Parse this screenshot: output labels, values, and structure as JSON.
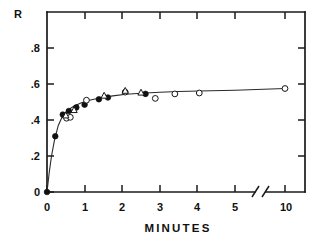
{
  "chart_data": {
    "type": "scatter",
    "title": "",
    "xlabel": "MINUTES",
    "ylabel": "R",
    "xlim": [
      0,
      10
    ],
    "ylim": [
      0,
      0.95
    ],
    "grid": false,
    "legend": "none",
    "axis_break": {
      "after": 5,
      "before": 10,
      "note": "x-axis broken between 5 and 10"
    },
    "xticks": [
      0,
      1,
      2,
      3,
      4,
      5,
      10
    ],
    "xtick_labels": [
      "0",
      "1",
      "2",
      "3",
      "4",
      "5",
      "10"
    ],
    "yticks": [
      0,
      0.2,
      0.4,
      0.6,
      0.8
    ],
    "ytick_labels": [
      "0",
      ".2",
      ".4",
      ".6",
      ".8"
    ],
    "series": [
      {
        "name": "filled-circles",
        "marker": "filled-circle",
        "x": [
          0.0,
          0.22,
          0.42,
          0.58,
          0.78,
          1.0,
          1.38,
          1.62,
          2.62
        ],
        "y": [
          0.0,
          0.31,
          0.43,
          0.45,
          0.47,
          0.485,
          0.515,
          0.525,
          0.545
        ]
      },
      {
        "name": "open-circles",
        "marker": "open-circle",
        "x": [
          0.52,
          0.62,
          1.05,
          2.08,
          2.88,
          3.4,
          4.05,
          10.0
        ],
        "y": [
          0.41,
          0.415,
          0.51,
          0.555,
          0.52,
          0.545,
          0.55,
          0.575
        ]
      },
      {
        "name": "open-triangles",
        "marker": "open-triangle",
        "x": [
          0.5,
          0.72,
          1.52,
          2.08,
          2.5
        ],
        "y": [
          0.425,
          0.455,
          0.535,
          0.562,
          0.552
        ]
      }
    ],
    "fitted_curve": {
      "description": "rising saturating curve through the data",
      "x": [
        0.0,
        0.06,
        0.12,
        0.2,
        0.3,
        0.42,
        0.55,
        0.7,
        0.9,
        1.1,
        1.4,
        1.75,
        2.1,
        2.5,
        3.0,
        3.5,
        4.05,
        5.0,
        10.0
      ],
      "y": [
        0.0,
        0.11,
        0.2,
        0.29,
        0.37,
        0.425,
        0.455,
        0.475,
        0.495,
        0.508,
        0.522,
        0.534,
        0.543,
        0.549,
        0.554,
        0.558,
        0.561,
        0.565,
        0.575
      ]
    },
    "colors": {
      "axis": "#1a1a1a",
      "curve": "#2a2a2a",
      "marker_fill": "#111111",
      "marker_open": "#ffffff",
      "background": "#ffffff"
    }
  }
}
